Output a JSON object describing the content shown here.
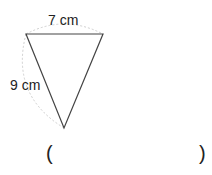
{
  "figure": {
    "shape": "triangle",
    "top_side_label": "7 cm",
    "left_side_label": "9 cm"
  },
  "answer": {
    "open_paren": "(",
    "close_paren": ")",
    "value": ""
  }
}
